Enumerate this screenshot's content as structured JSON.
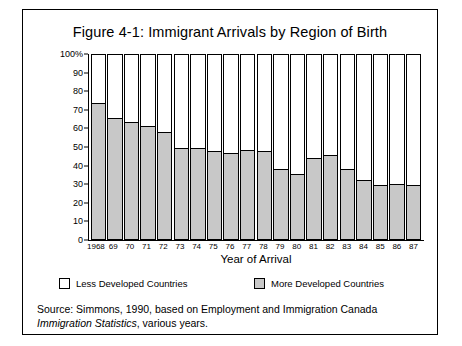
{
  "figure": {
    "title": "Figure 4-1: Immigrant Arrivals by Region of Birth",
    "frame_color": "#000000",
    "background": "#ffffff"
  },
  "axes": {
    "x_title": "Year of Arrival",
    "y_ticks": [
      "100%",
      "90",
      "80",
      "70",
      "60",
      "50",
      "40",
      "30",
      "20",
      "10",
      "0"
    ],
    "y_tick_values": [
      100,
      90,
      80,
      70,
      60,
      50,
      40,
      30,
      20,
      10,
      0
    ]
  },
  "legend": {
    "position": "below-axis",
    "items": [
      {
        "label": "Less Developed Countries",
        "color": "#ffffff",
        "swatch": "white-square"
      },
      {
        "label": "More Developed Countries",
        "color": "#c8c8c8",
        "swatch": "gray-square"
      }
    ]
  },
  "source": {
    "line1": "Source: Simmons, 1990, based on Employment and Immigration Canada",
    "line2_italic": "Immigration Statistics",
    "line2_rest": ", various years."
  },
  "chart_data": {
    "type": "bar",
    "subtype": "stacked-100-percent",
    "title": "Figure 4-1: Immigrant Arrivals by Region of Birth",
    "xlabel": "Year of Arrival",
    "ylabel": "",
    "ylim": [
      0,
      100
    ],
    "y_unit": "percent",
    "grid": false,
    "legend_position": "bottom",
    "categories": [
      "1968",
      "69",
      "70",
      "71",
      "72",
      "73",
      "74",
      "75",
      "76",
      "77",
      "78",
      "79",
      "80",
      "81",
      "82",
      "83",
      "84",
      "85",
      "86",
      "87"
    ],
    "series": [
      {
        "name": "More Developed Countries",
        "color": "#c8c8c8",
        "values": [
          74,
          66,
          63.5,
          61.5,
          58,
          49.5,
          49.5,
          48,
          47,
          48.5,
          48,
          38,
          35.5,
          44,
          45.5,
          38,
          32,
          29.5,
          30,
          29.5
        ]
      },
      {
        "name": "Less Developed Countries",
        "color": "#ffffff",
        "values": [
          26,
          34,
          36.5,
          38.5,
          42,
          50.5,
          50.5,
          52,
          53,
          51.5,
          52,
          62,
          64.5,
          56,
          54.5,
          62,
          68,
          70.5,
          70,
          70.5
        ]
      }
    ]
  }
}
